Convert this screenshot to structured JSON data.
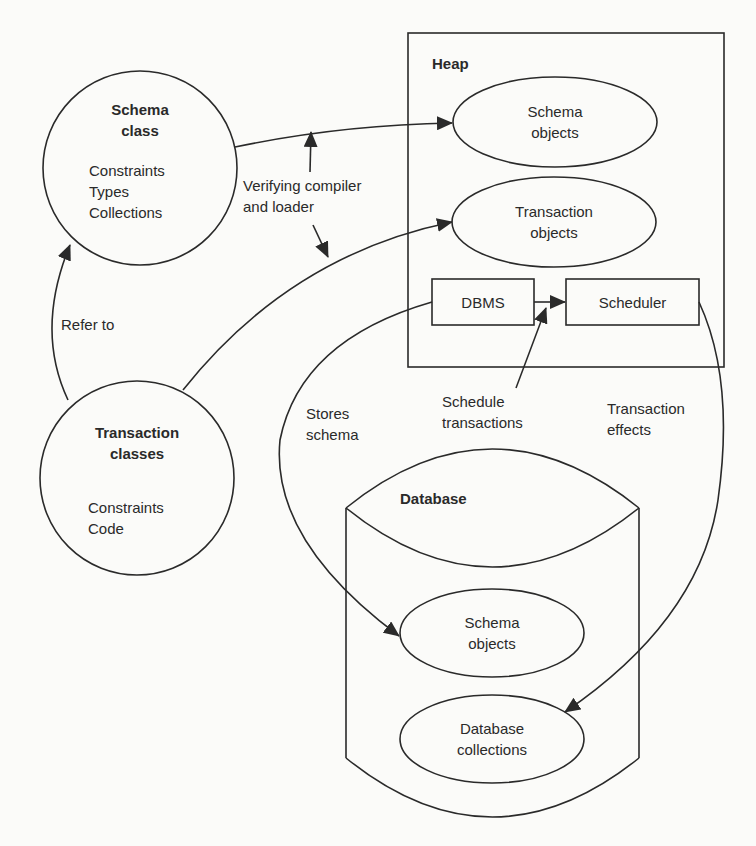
{
  "nodes": {
    "schema_class": {
      "title": "Schema class",
      "title_line1": "Schema",
      "title_line2": "class",
      "items": [
        "Constraints",
        "Types",
        "Collections"
      ]
    },
    "transaction_classes": {
      "title_line1": "Transaction",
      "title_line2": "classes",
      "items": [
        "Constraints",
        "Code"
      ]
    },
    "heap": {
      "title": "Heap",
      "schema_objects": {
        "line1": "Schema",
        "line2": "objects"
      },
      "transaction_objects": {
        "line1": "Transaction",
        "line2": "objects"
      },
      "dbms": "DBMS",
      "scheduler": "Scheduler"
    },
    "database": {
      "title": "Database",
      "schema_objects": {
        "line1": "Schema",
        "line2": "objects"
      },
      "collections": {
        "line1": "Database",
        "line2": "collections"
      }
    }
  },
  "edges": {
    "refer_to": "Refer to",
    "verifying": {
      "line1": "Verifying compiler",
      "line2": "and loader"
    },
    "stores_schema": {
      "line1": "Stores",
      "line2": "schema"
    },
    "schedule_transactions": {
      "line1": "Schedule",
      "line2": "transactions"
    },
    "transaction_effects": {
      "line1": "Transaction",
      "line2": "effects"
    }
  },
  "colors": {
    "stroke": "#2a2a2a",
    "background": "#fbfbf9"
  }
}
